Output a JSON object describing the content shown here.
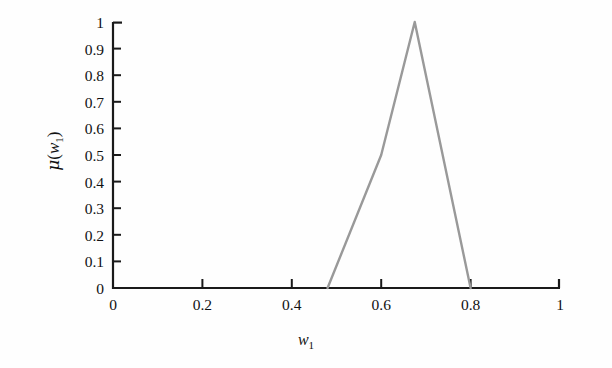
{
  "figure": {
    "background_color": "#fefefe",
    "axis_color": "#1a1a1a",
    "curve_color": "#999999"
  },
  "axes": {
    "x_label_mu": "",
    "x_label_var": "w",
    "x_label_sub": "1",
    "y_label_mu": "μ",
    "y_label_open": "(",
    "y_label_var": "w",
    "y_label_sub": "1",
    "y_label_close": ")"
  },
  "chart_data": {
    "type": "line",
    "title": "",
    "xlabel": "w1",
    "ylabel": "μ(w1)",
    "xlim": [
      0,
      1
    ],
    "ylim": [
      0,
      1
    ],
    "grid": false,
    "legend": null,
    "xticks": [
      "0",
      "0.2",
      "0.4",
      "0.6",
      "0.8",
      "1"
    ],
    "xtick_values": [
      0,
      0.2,
      0.4,
      0.6,
      0.8,
      1
    ],
    "yticks": [
      "0",
      "0.1",
      "0.2",
      "0.3",
      "0.4",
      "0.5",
      "0.6",
      "0.7",
      "0.8",
      "0.9",
      "1"
    ],
    "ytick_values": [
      0,
      0.1,
      0.2,
      0.3,
      0.4,
      0.5,
      0.6,
      0.7,
      0.8,
      0.9,
      1
    ],
    "series": [
      {
        "name": "membership-function",
        "color": "#999999",
        "x": [
          0.48,
          0.6,
          0.675,
          0.8
        ],
        "y": [
          0.0,
          0.5,
          1.0,
          0.0
        ]
      }
    ]
  }
}
